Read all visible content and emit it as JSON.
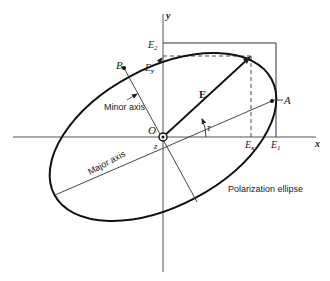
{
  "figure": {
    "title": "Polarization ellipse",
    "labels": {
      "y_axis": "y",
      "x_axis": "x",
      "z_axis": "z",
      "origin": "O",
      "E2": "E",
      "E2_sub": "2",
      "E1": "E",
      "E1_sub": "1",
      "Ey": "E",
      "Ey_sub": "y",
      "Ex": "E",
      "Ex_sub": "x",
      "E_vector": "E",
      "point_A": "A",
      "point_B": "B",
      "tau": "τ",
      "minor_axis": "Minor axis",
      "major_axis": "Major axis",
      "ellipse": "Polarization ellipse"
    },
    "colors": {
      "line": "#222222",
      "axis": "#555555",
      "background": "#ffffff"
    }
  }
}
